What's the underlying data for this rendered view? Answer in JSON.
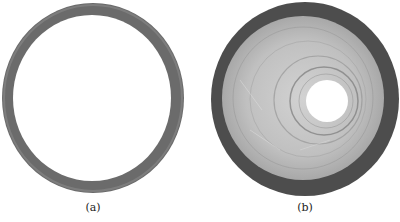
{
  "figure": {
    "panels": [
      {
        "label": "(a)",
        "description": "thin gray metal ring",
        "colors": {
          "ring": "#6e6e6e",
          "ring_edge": "#8a8a8a",
          "inner": "#ffffff"
        }
      },
      {
        "label": "(b)",
        "description": "disk with dark outer rim, light textured worn inner surface and central hole",
        "colors": {
          "rim": "#4a4a4a",
          "surface": "#b8b8b8",
          "surface_light": "#d6d6d6",
          "groove": "#8c8c8c",
          "hole": "#ffffff"
        }
      }
    ]
  }
}
